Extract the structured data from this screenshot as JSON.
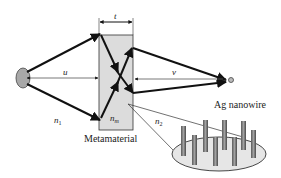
{
  "diagram": {
    "labels": {
      "thickness": "t",
      "object_distance": "u",
      "image_distance": "v",
      "n1": "n",
      "n1_sub": "1",
      "nm": "n",
      "nm_sub": "m",
      "n2": "n",
      "n2_sub": "2",
      "metamaterial": "Metamaterial",
      "nanowire": "Ag nanowire"
    },
    "colors": {
      "slab_fill": "#dcdcdc",
      "source_fill": "#a8a8a8",
      "ray": "#111111",
      "nanowire": "#8a8a8a",
      "ellipse_fill": "#e6e6e6"
    }
  }
}
